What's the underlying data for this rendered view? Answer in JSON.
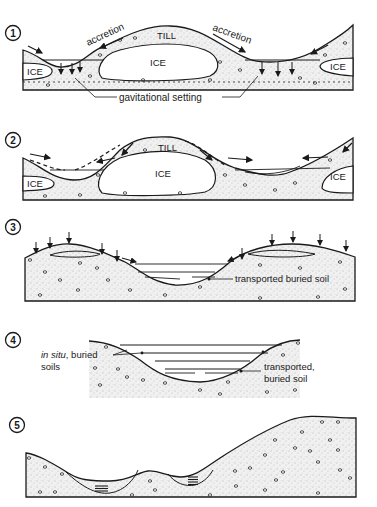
{
  "figure": {
    "background": "#ffffff",
    "ink": "#1a1a1a",
    "fill_stipple": "#ececec",
    "panels": [
      {
        "number": "1",
        "labels": {
          "accretion_left": "accretion",
          "accretion_right": "accretion",
          "till": "TILL",
          "ice_center": "ICE",
          "ice_left": "ICE",
          "ice_right": "ICE",
          "gravitational": "gavitational setting"
        }
      },
      {
        "number": "2",
        "labels": {
          "till": "TILL",
          "ice_center": "ICE",
          "ice_left": "ICE",
          "ice_right": "ICE"
        }
      },
      {
        "number": "3",
        "labels": {
          "transported": "transported buried soil"
        }
      },
      {
        "number": "4",
        "labels": {
          "in_situ_italic": "in situ",
          "in_situ_rest": ", buried",
          "in_situ_line2": "soils",
          "transported_line1": "transported,",
          "transported_line2": "buried soil"
        }
      },
      {
        "number": "5",
        "labels": {}
      }
    ]
  }
}
